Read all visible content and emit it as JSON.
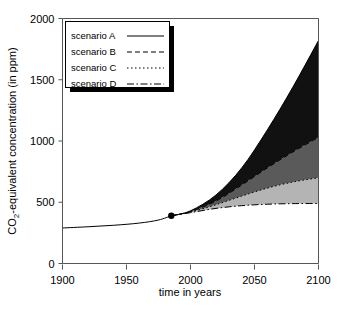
{
  "chart_data": {
    "type": "area",
    "title": "",
    "xlabel": "time in years",
    "ylabel": "CO₂-equivalent concentration (in ppm)",
    "xlim": [
      1900,
      2100
    ],
    "ylim": [
      0,
      2000
    ],
    "xticks": [
      1900,
      1950,
      2000,
      2050,
      2100
    ],
    "yticks": [
      0,
      500,
      1000,
      1500,
      2000
    ],
    "grid": false,
    "legend_position": "top-left",
    "branch_point": {
      "x": 1985,
      "y": 390,
      "marker": "filled-circle"
    },
    "historical": {
      "name": "historical",
      "x": [
        1900,
        1920,
        1940,
        1960,
        1975,
        1985
      ],
      "y": [
        290,
        300,
        312,
        330,
        355,
        390
      ]
    },
    "series": [
      {
        "name": "scenario A",
        "style": "solid",
        "x": [
          1985,
          2000,
          2020,
          2040,
          2060,
          2080,
          2100
        ],
        "y": [
          390,
          430,
          560,
          780,
          1090,
          1440,
          1820
        ]
      },
      {
        "name": "scenario B",
        "style": "dashed",
        "x": [
          1985,
          2000,
          2020,
          2040,
          2060,
          2080,
          2100
        ],
        "y": [
          390,
          425,
          510,
          640,
          780,
          910,
          1030
        ]
      },
      {
        "name": "scenario C",
        "style": "dotted",
        "x": [
          1985,
          2000,
          2020,
          2040,
          2060,
          2080,
          2100
        ],
        "y": [
          390,
          420,
          480,
          550,
          615,
          665,
          700
        ]
      },
      {
        "name": "scenario D",
        "style": "dash-dot",
        "x": [
          1985,
          2000,
          2020,
          2040,
          2060,
          2080,
          2100
        ],
        "y": [
          390,
          415,
          450,
          472,
          484,
          489,
          490
        ]
      }
    ],
    "bands": [
      {
        "name": "band-A-B",
        "upper": "scenario A",
        "lower": "scenario B",
        "color": "#111111"
      },
      {
        "name": "band-B-C",
        "upper": "scenario B",
        "lower": "scenario C",
        "color": "#5a5a5a"
      },
      {
        "name": "band-C-D",
        "upper": "scenario C",
        "lower": "scenario D",
        "color": "#b4b4b4"
      }
    ],
    "legend": [
      {
        "label": "scenario A",
        "style": "solid"
      },
      {
        "label": "scenario B",
        "style": "dashed"
      },
      {
        "label": "scenario C",
        "style": "dotted"
      },
      {
        "label": "scenario D",
        "style": "dash-dot"
      }
    ]
  }
}
